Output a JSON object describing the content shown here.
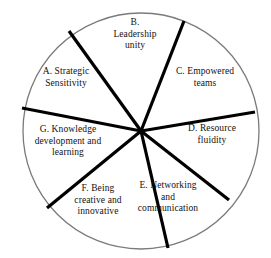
{
  "diagram": {
    "type": "pie-wheel",
    "title": "",
    "shape": "circle",
    "segment_count": 7,
    "colors": {
      "background": "#ffffff",
      "outline": "#7a7a7a",
      "spoke": "#000000",
      "text": "#111111"
    },
    "geometry": {
      "center_x": 141,
      "center_y": 131,
      "radius": 118,
      "outline_width": 1.2,
      "spoke_width": 3.2
    },
    "segments": [
      {
        "key": "A",
        "label": "A. Strategic\nSensitivity",
        "lines": [
          "A. Strategic",
          "Sensitivity"
        ],
        "start_angle": 208,
        "end_angle": 261
      },
      {
        "key": "B",
        "label": "B.\nLeadership\nunity",
        "lines": [
          "B.",
          "Leadership",
          "unity"
        ],
        "start_angle": 261,
        "end_angle": 311
      },
      {
        "key": "C",
        "label": "C. Empowered\nteams",
        "lines": [
          "C. Empowered",
          "teams"
        ],
        "start_angle": 311,
        "end_angle": 351
      },
      {
        "key": "D",
        "label": "D. Resource\nfluidity",
        "lines": [
          "D. Resource",
          "fluidity"
        ],
        "start_angle": 351,
        "end_angle": 396
      },
      {
        "key": "E",
        "label": "E. Networking\nand\ncommunication",
        "lines": [
          "E. Networking",
          "and",
          "communication"
        ],
        "start_angle": 36,
        "end_angle": 81
      },
      {
        "key": "F",
        "label": "F. Being\ncreative and\ninnovative",
        "lines": [
          "F. Being",
          "creative and",
          "innovative"
        ],
        "start_angle": 81,
        "end_angle": 131
      },
      {
        "key": "G",
        "label": "G. Knowledge\ndevelopment and\nlearning",
        "lines": [
          "G. Knowledge",
          "development and",
          "learning"
        ],
        "start_angle": 131,
        "end_angle": 208
      }
    ]
  }
}
